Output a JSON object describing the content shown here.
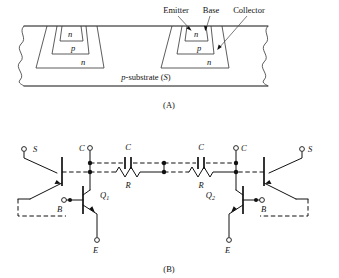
{
  "figure": {
    "panel_a": {
      "caption": "(A)",
      "title_labels": [
        "Emitter",
        "Base",
        "Collector"
      ],
      "region_labels": {
        "emitter_n": "n",
        "base_p": "p",
        "collector_n": "n"
      },
      "substrate_label_italic": "p",
      "substrate_label_rest": "-substrate (",
      "substrate_label_s": "S",
      "substrate_label_close": ")",
      "devices": [
        {
          "emitter": "n",
          "base": "p",
          "well": "n"
        },
        {
          "emitter": "n",
          "base": "p",
          "well": "n"
        }
      ]
    },
    "panel_b": {
      "caption": "(B)",
      "terminals": {
        "substrate_left": "S",
        "substrate_right": "S",
        "collector_left": "C",
        "collector_right": "C",
        "base_left": "B",
        "base_right": "B",
        "emitter_left": "E",
        "emitter_right": "E"
      },
      "transistors": {
        "q1": "Q",
        "q1_sub": "1",
        "q2": "Q",
        "q2_sub": "2"
      },
      "components": {
        "cap_left": "C",
        "cap_right": "C",
        "res_left": "R",
        "res_right": "R"
      }
    }
  },
  "colors": {
    "ink": "#111111",
    "background": "#ffffff",
    "hatch": "#444444"
  }
}
